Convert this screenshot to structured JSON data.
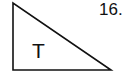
{
  "figure": {
    "shape": "right-triangle",
    "vertices": [
      [
        13,
        3
      ],
      [
        13,
        70
      ],
      [
        111,
        70
      ]
    ],
    "stroke_color": "#111111",
    "fill_color": "#ffffff",
    "inner_label": "T"
  },
  "problem_number": "16."
}
